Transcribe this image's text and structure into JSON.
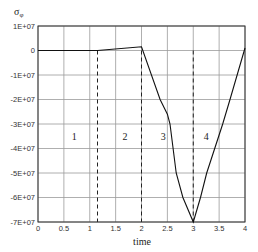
{
  "chart_data": {
    "type": "line",
    "title": "",
    "xlabel": "time",
    "ylabel": "σφ",
    "xlim": [
      0,
      4
    ],
    "ylim": [
      -70000000,
      10000000
    ],
    "grid": true,
    "x_ticks": [
      0,
      0.5,
      1,
      1.5,
      2,
      2.5,
      3,
      3.5,
      4
    ],
    "x_tick_labels": [
      "0",
      "0.5",
      "1",
      "1.5",
      "2",
      "2.5",
      "3",
      "3.5",
      "4"
    ],
    "y_ticks": [
      10000000,
      0,
      -10000000,
      -20000000,
      -30000000,
      -40000000,
      -50000000,
      -60000000,
      -70000000
    ],
    "y_tick_labels": [
      "1E+07",
      "0",
      "-1E+07",
      "-2E+07",
      "-3E+07",
      "-4E+07",
      "-5E+07",
      "-6E+07",
      "-7E+07"
    ],
    "series": [
      {
        "name": "σφ",
        "x": [
          0,
          1.15,
          2.0,
          2.36,
          2.5,
          2.55,
          2.67,
          2.8,
          3.0,
          3.14,
          3.26,
          3.57,
          3.71,
          4.0
        ],
        "values": [
          0,
          0,
          1500000,
          -20000000,
          -26000000,
          -30000000,
          -50000000,
          -60000000,
          -70000000,
          -60000000,
          -50000000,
          -30000000,
          -20000000,
          1000000
        ]
      }
    ],
    "phase_boundaries": [
      1.15,
      2.0,
      3.0
    ],
    "annotations": [
      {
        "text": "1",
        "x": 0.7,
        "y": -35000000
      },
      {
        "text": "2",
        "x": 1.68,
        "y": -35000000
      },
      {
        "text": "3",
        "x": 2.42,
        "y": -35000000
      },
      {
        "text": "4",
        "x": 3.25,
        "y": -35000000
      }
    ]
  },
  "labels": {
    "ylabel_main": "σ",
    "ylabel_sub": "φ",
    "xlabel": "time"
  }
}
